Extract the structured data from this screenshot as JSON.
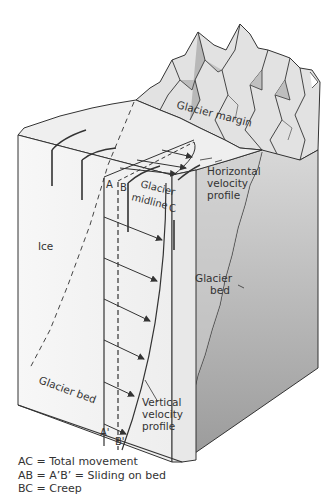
{
  "diagram": {
    "labels": {
      "glacier_margin": "Glacier margin",
      "horizontal_profile_1": "Horizontal",
      "horizontal_profile_2": "velocity",
      "horizontal_profile_3": "profile",
      "point_a": "A",
      "point_b": "B",
      "point_c": "C",
      "glacier_midline_1": "Glacier",
      "glacier_midline_2": "midline",
      "ice": "Ice",
      "glacier_bed_right_1": "Glacier",
      "glacier_bed_right_2": "bed",
      "glacier_bed_front": "Glacier bed",
      "vertical_profile_1": "Vertical",
      "vertical_profile_2": "velocity",
      "vertical_profile_3": "profile",
      "point_a_prime": "A'",
      "point_b_prime": "B'"
    },
    "colors": {
      "ice_front": "#f4f4f4",
      "ice_top": "#ececec",
      "bed_side": "#a9a9a9",
      "mountain_light": "#e6e6e6",
      "mountain_dark": "#b5b5b5",
      "line": "#333333"
    }
  },
  "legend": {
    "items": [
      "AC = Total movement",
      "AB = A’B’ = Sliding on bed",
      "BC = Creep"
    ]
  }
}
